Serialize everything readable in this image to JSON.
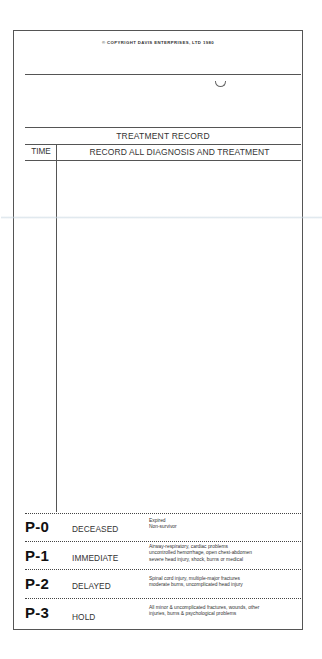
{
  "form": {
    "copyright": "© COPYRIGHT DAVIS ENTERPRISES, LTD 1980",
    "section_title": "TREATMENT RECORD",
    "columns": {
      "time": "TIME",
      "record": "RECORD ALL DIAGNOSIS AND TREATMENT"
    },
    "time_entry": "",
    "record_entry": ""
  },
  "priorities": [
    {
      "code": "P-0",
      "name": "DECEASED",
      "description": [
        "Expired",
        "Non-survivor"
      ]
    },
    {
      "code": "P-1",
      "name": "IMMEDIATE",
      "description": [
        "Airway-respiratory, cardiac problems",
        "uncontrolled hemorrhage, open chest-abdomen",
        "severe head injury, shock, burns or medical"
      ]
    },
    {
      "code": "P-2",
      "name": "DELAYED",
      "description": [
        "Spinal cord injury, multiple-major fractures",
        "moderate burns, uncomplicated head injury"
      ]
    },
    {
      "code": "P-3",
      "name": "HOLD",
      "description": [
        "All minor & uncomplicated fractures, wounds, other",
        "injuries, burns & psychological problems"
      ]
    }
  ],
  "colors": {
    "ink": "#222222",
    "border": "#555555",
    "paper": "#ffffff"
  }
}
